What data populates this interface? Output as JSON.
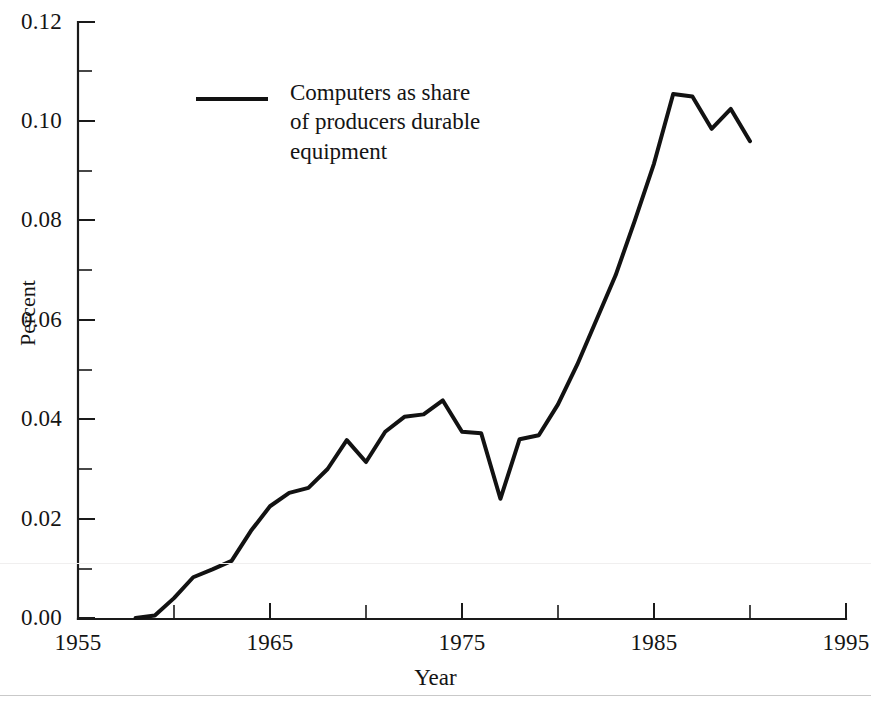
{
  "chart_data": {
    "type": "line",
    "title": "",
    "xlabel": "Year",
    "ylabel": "Percent",
    "xlim": [
      1955,
      1995
    ],
    "ylim": [
      0.0,
      0.12
    ],
    "grid": false,
    "legend_position": "upper-left-inside",
    "x_major_ticks": [
      1955,
      1965,
      1975,
      1985,
      1995
    ],
    "x_minor_ticks": [
      1960,
      1970,
      1980,
      1990
    ],
    "x_tick_labels": [
      "1955",
      "1965",
      "1975",
      "1985",
      "1995"
    ],
    "y_major_ticks": [
      0.0,
      0.02,
      0.04,
      0.06,
      0.08,
      0.1,
      0.12
    ],
    "y_minor_ticks": [
      0.01,
      0.03,
      0.05,
      0.07,
      0.09,
      0.11
    ],
    "y_tick_labels": [
      "0.00",
      "0.02",
      "0.04",
      "0.06",
      "0.08",
      "0.10",
      "0.12"
    ],
    "series": [
      {
        "name": "Computers as share of producers durable equipment",
        "color": "#121212",
        "x": [
          1958,
          1959,
          1960,
          1961,
          1962,
          1963,
          1964,
          1965,
          1966,
          1967,
          1968,
          1969,
          1970,
          1971,
          1972,
          1973,
          1974,
          1975,
          1976,
          1977,
          1978,
          1979,
          1980,
          1981,
          1982,
          1983,
          1984,
          1985,
          1986,
          1987,
          1988,
          1989,
          1990
        ],
        "y": [
          0.0,
          0.0005,
          0.004,
          0.0082,
          0.0098,
          0.0115,
          0.0175,
          0.0225,
          0.0252,
          0.0262,
          0.03,
          0.0358,
          0.0314,
          0.0375,
          0.0405,
          0.041,
          0.0438,
          0.0375,
          0.0372,
          0.024,
          0.036,
          0.0368,
          0.043,
          0.051,
          0.06,
          0.069,
          0.08,
          0.0915,
          0.1055,
          0.105,
          0.0985,
          0.1025,
          0.096
        ],
        "x_pixel_note": "rendered via explicit polyline points"
      }
    ],
    "legend_entries": [
      {
        "label_lines": [
          "Computers as share",
          "of producers durable",
          "equipment"
        ],
        "label": "Computers as share of producers durable equipment",
        "marker": "line",
        "color": "#121212"
      }
    ]
  },
  "axes": {
    "y_title": "Percent",
    "x_title": "Year"
  },
  "colors": {
    "line": "#121212",
    "axis": "#1a1a1a",
    "background": "#ffffff",
    "rule": "#c9c9c9"
  }
}
